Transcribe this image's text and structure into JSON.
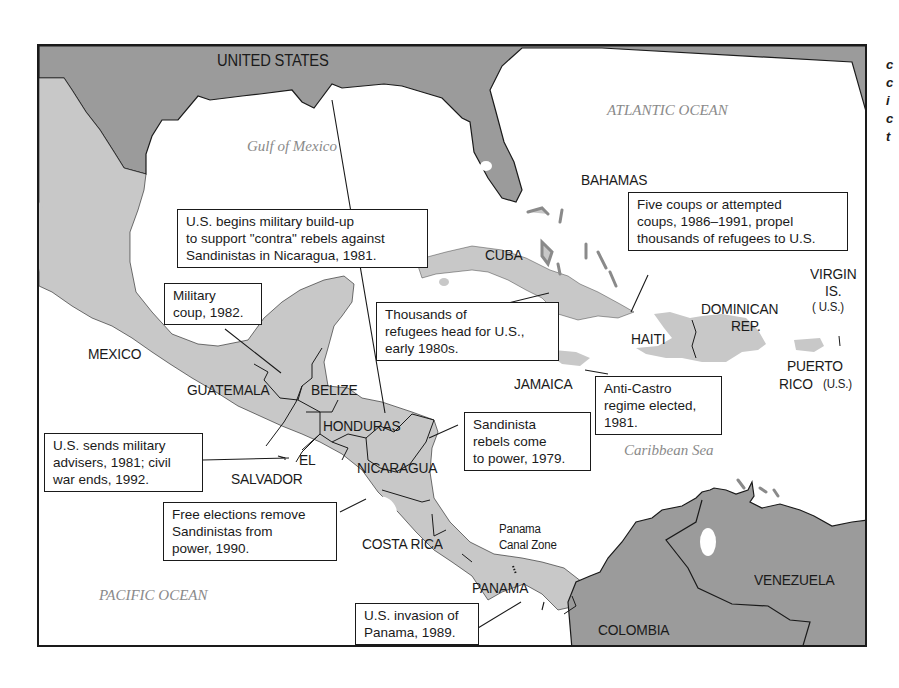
{
  "map": {
    "colors": {
      "us_venezuela_colombia_land": "#9b9b9b",
      "central_america_caribbean_land": "#c8c8c8",
      "water": "#ffffff",
      "border": "#1a1a1a",
      "water_label": "#8a8a8a"
    },
    "country_labels": {
      "united_states": "UNITED STATES",
      "bahamas": "BAHAMAS",
      "cuba": "CUBA",
      "mexico": "MEXICO",
      "guatemala": "GUATEMALA",
      "belize": "BELIZE",
      "honduras": "HONDURAS",
      "el": "EL",
      "salvador": "SALVADOR",
      "nicaragua": "NICARAGUA",
      "costa_rica": "COSTA RICA",
      "panama": "PANAMA",
      "panama_canal_zone_1": "Panama",
      "panama_canal_zone_2": "Canal Zone",
      "haiti": "HAITI",
      "dominican_1": "DOMINICAN",
      "dominican_2": "REP.",
      "jamaica": "JAMAICA",
      "virgin_1": "VIRGIN",
      "virgin_2": "IS.",
      "virgin_3": "( U.S.)",
      "puerto_1": "PUERTO",
      "puerto_2": "RICO",
      "puerto_3": "(U.S.)",
      "venezuela": "VENEZUELA",
      "colombia": "COLOMBIA"
    },
    "water_labels": {
      "gulf": "Gulf of Mexico",
      "atlantic": "ATLANTIC OCEAN",
      "caribbean": "Caribbean Sea",
      "pacific": "PACIFIC OCEAN"
    },
    "callouts": {
      "contra": [
        "U.S. begins military build-up",
        "to support \"contra\" rebels against",
        "Sandinistas in Nicaragua, 1981."
      ],
      "haiti_coups": [
        "Five coups or attempted",
        "coups, 1986–1991, propel",
        "thousands of refugees to U.S."
      ],
      "guatemala_coup": [
        "Military",
        "coup, 1982."
      ],
      "cuba_refugees": [
        "Thousands of",
        "refugees head for  U.S.,",
        "early 1980s."
      ],
      "jamaica_regime": [
        "Anti-Castro",
        "regime elected,",
        "1981."
      ],
      "sandinista_power": [
        "Sandinista",
        "rebels come",
        "to power, 1979."
      ],
      "el_salvador": [
        "U.S. sends military",
        "advisers, 1981; civil",
        "war ends, 1992."
      ],
      "free_elections": [
        "Free elections remove",
        "Sandinistas from",
        "power, 1990."
      ],
      "panama_invasion": [
        "U.S. invasion of",
        "Panama, 1989."
      ]
    },
    "side_text_fragments": [
      "c",
      "c",
      "i",
      "c",
      "t"
    ]
  }
}
